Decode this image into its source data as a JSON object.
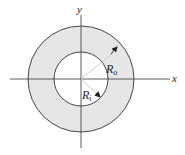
{
  "figure": {
    "type": "annulus-cross-section",
    "axes": {
      "x_label": "x",
      "y_label": "y"
    },
    "radii": {
      "outer": {
        "symbol": "R",
        "subscript": "o"
      },
      "inner": {
        "symbol": "R",
        "subscript": "i"
      }
    },
    "colors": {
      "annulus_fill": "#e6e6e6",
      "stroke": "#333333",
      "radius_line": "#c8c8c8",
      "background": "#ffffff"
    }
  }
}
